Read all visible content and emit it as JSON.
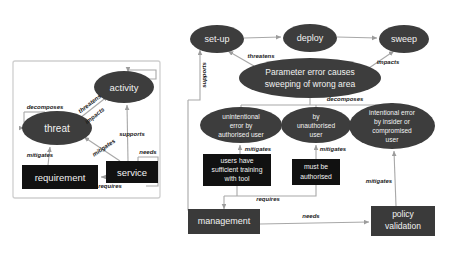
{
  "figure": {
    "title": "",
    "panels": [
      {
        "id": "left",
        "name": "meta-model-panel"
      },
      {
        "id": "right",
        "name": "instantiated-model-panel"
      }
    ]
  },
  "colors": {
    "ellipse_fill": "#3d3d3d",
    "box_fill": "#111111",
    "node_text": "#f2f2f2",
    "edge_line": "#a8a8a8",
    "edge_label_text": "#1a1a1a",
    "panel_border": "#cfcfcf",
    "background": "#ffffff"
  },
  "left_panel": {
    "nodes": [
      {
        "id": "threat",
        "label": "threat",
        "shape": "ellipse",
        "cx": 57,
        "cy": 128,
        "rx": 35,
        "ry": 17
      },
      {
        "id": "activity",
        "label": "activity",
        "shape": "ellipse",
        "cx": 124,
        "cy": 87,
        "rx": 30,
        "ry": 16
      },
      {
        "id": "requirement",
        "label": "requirement",
        "shape": "rect",
        "cx": 60,
        "cy": 177,
        "w": 76,
        "h": 24
      },
      {
        "id": "service",
        "label": "service",
        "shape": "rect",
        "cx": 132,
        "cy": 172,
        "w": 52,
        "h": 22
      }
    ],
    "edges": [
      {
        "from": "threat",
        "to": "threat",
        "label": "decomposes",
        "lx": 45,
        "ly": 108
      },
      {
        "from": "threat",
        "to": "activity",
        "label": "threatens",
        "lx": 88,
        "ly": 106
      },
      {
        "from": "threat",
        "to": "activity",
        "label": "impacts",
        "lx": 91,
        "ly": 117
      },
      {
        "from": "requirement",
        "to": "threat",
        "label": "mitigates",
        "lx": 40,
        "ly": 155
      },
      {
        "from": "service",
        "to": "threat",
        "label": "mitigates",
        "lx": 103,
        "ly": 148
      },
      {
        "from": "service",
        "to": "activity",
        "label": "supports",
        "lx": 130,
        "ly": 133
      },
      {
        "from": "service",
        "to": "service",
        "label": "needs",
        "lx": 147,
        "ly": 152
      },
      {
        "from": "service",
        "to": "requirement",
        "label": "requires",
        "lx": 107,
        "ly": 183
      }
    ]
  },
  "right_panel": {
    "nodes": [
      {
        "id": "set-up",
        "label": "set-up",
        "shape": "ellipse",
        "cx": 217,
        "cy": 39,
        "rx": 27,
        "ry": 14
      },
      {
        "id": "deploy",
        "label": "deploy",
        "shape": "ellipse",
        "cx": 310,
        "cy": 38,
        "rx": 27,
        "ry": 14
      },
      {
        "id": "sweep",
        "label": "sweep",
        "shape": "ellipse",
        "cx": 404,
        "cy": 39,
        "rx": 25,
        "ry": 14
      },
      {
        "id": "param-error",
        "label_lines": [
          "Parameter error causes",
          "sweeping of wrong area"
        ],
        "shape": "ellipse",
        "cx": 310,
        "cy": 78,
        "rx": 71,
        "ry": 20
      },
      {
        "id": "unintentional",
        "label_lines": [
          "unintentional",
          "error by",
          "authorised user"
        ],
        "shape": "ellipse",
        "cx": 241,
        "cy": 125,
        "rx": 41,
        "ry": 18
      },
      {
        "id": "unauthorised",
        "label_lines": [
          "by",
          "unauthorised",
          "user"
        ],
        "shape": "ellipse",
        "cx": 316,
        "cy": 125,
        "rx": 35,
        "ry": 18
      },
      {
        "id": "intentional",
        "label_lines": [
          "intentional error",
          "by insider or",
          "compromised",
          "user"
        ],
        "shape": "ellipse",
        "cx": 392,
        "cy": 126,
        "rx": 43,
        "ry": 23
      },
      {
        "id": "training",
        "label_lines": [
          "users have",
          "sufficient training",
          "with tool"
        ],
        "shape": "rect",
        "cx": 237,
        "cy": 170,
        "w": 68,
        "h": 32
      },
      {
        "id": "must-auth",
        "label_lines": [
          "must be",
          "authorised"
        ],
        "shape": "rect",
        "cx": 316,
        "cy": 172,
        "w": 48,
        "h": 26
      },
      {
        "id": "management",
        "label": "management",
        "shape": "rect",
        "cx": 224,
        "cy": 222,
        "w": 72,
        "h": 25
      },
      {
        "id": "policy-validation",
        "label_lines": [
          "policy",
          "validation"
        ],
        "shape": "rect",
        "cx": 403,
        "cy": 221,
        "w": 64,
        "h": 30
      }
    ],
    "edges": [
      {
        "from": "set-up",
        "to": "deploy",
        "label": "",
        "lx": 0,
        "ly": 0
      },
      {
        "from": "deploy",
        "to": "sweep",
        "label": "",
        "lx": 0,
        "ly": 0
      },
      {
        "from": "param-error",
        "to": "set-up",
        "label": "threatens",
        "lx": 261,
        "ly": 55
      },
      {
        "from": "param-error",
        "to": "sweep",
        "label": "impacts",
        "lx": 386,
        "ly": 61
      },
      {
        "from": "management",
        "to": "set-up",
        "label": "supports",
        "lx": 204,
        "ly": 75
      },
      {
        "from": "param-error",
        "to": "children",
        "label": "decomposes",
        "lx": 345,
        "ly": 98
      },
      {
        "from": "training",
        "to": "unintentional",
        "label": "mitigates",
        "lx": 254,
        "ly": 148
      },
      {
        "from": "must-auth",
        "to": "unauthorised",
        "label": "mitigates",
        "lx": 328,
        "ly": 148
      },
      {
        "from": "policy-validation",
        "to": "intentional",
        "label": "mitigates",
        "lx": 381,
        "ly": 180
      },
      {
        "from": "management",
        "to": "training",
        "label": "requires",
        "lx": 266,
        "ly": 201
      },
      {
        "from": "management",
        "to": "policy-validation",
        "label": "needs",
        "lx": 309,
        "ly": 216
      }
    ]
  }
}
